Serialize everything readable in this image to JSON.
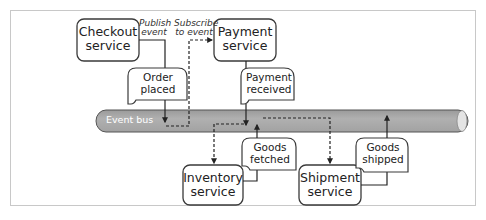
{
  "diagram": {
    "type": "event-driven architecture",
    "colors": {
      "border": "#3a3a3a",
      "bus_fill": "#a9a9a9",
      "bus_cap": "#e4e4e4",
      "frame": "#c8c8c8",
      "bus_text": "#ffffff"
    },
    "event_bus": {
      "label": "Event bus"
    },
    "services": [
      {
        "id": "checkout",
        "line1": "Checkout",
        "line2": "service"
      },
      {
        "id": "payment",
        "line1": "Payment",
        "line2": "service"
      },
      {
        "id": "inventory",
        "line1": "Inventory",
        "line2": "service"
      },
      {
        "id": "shipment",
        "line1": "Shipment",
        "line2": "service"
      }
    ],
    "events": [
      {
        "id": "order_placed",
        "line1": "Order",
        "line2": "placed"
      },
      {
        "id": "payment_received",
        "line1": "Payment",
        "line2": "received"
      },
      {
        "id": "goods_fetched",
        "line1": "Goods",
        "line2": "fetched"
      },
      {
        "id": "goods_shipped",
        "line1": "Goods",
        "line2": "shipped"
      }
    ],
    "annotations": {
      "publish": {
        "line1": "Publish",
        "line2": "event"
      },
      "subscribe": {
        "line1": "Subscribe",
        "line2": "to event"
      }
    },
    "legend": {
      "solid_arrow": "publish event",
      "dashed_arrow": "subscribe to event"
    }
  }
}
